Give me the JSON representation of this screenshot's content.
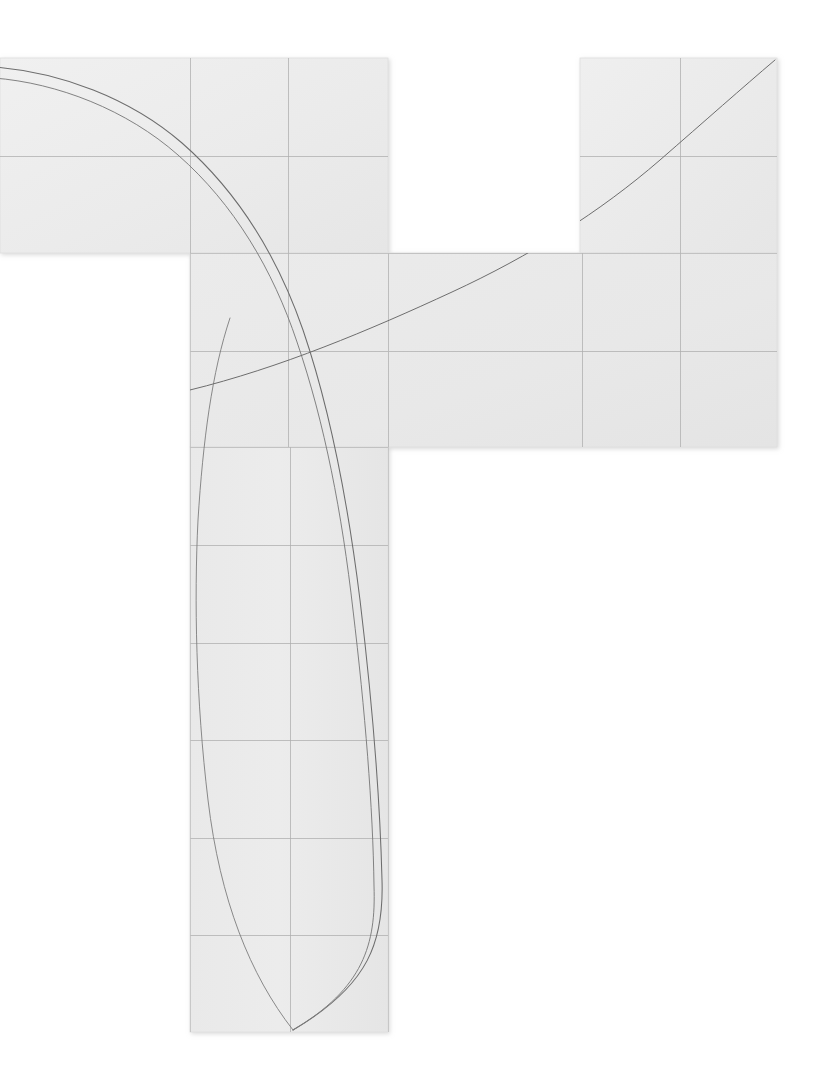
{
  "canvas": {
    "width": 825,
    "height": 1076,
    "background": "#ffffff",
    "title": "Folded grid surface with drawn curves"
  },
  "palette": {
    "paper_fill_light": "#ededed",
    "paper_fill_mid": "#e9e9e9",
    "paper_fill_dark": "#e4e4e4",
    "paper_edge": "#dcdcdc",
    "grid_line": "#a8a8a8",
    "grid_line_soft": "#bdbdbd",
    "curve_stroke": "#6d6d6d",
    "curve_stroke_light": "#8a8a8a",
    "shadow": "#d5d5d5"
  },
  "geometry": {
    "grid_step_x": 98,
    "grid_step_y": 97,
    "vertical_gridlines_x": [
      190,
      288,
      388,
      582,
      680,
      777
    ],
    "horizontal_gridlines_y": [
      156,
      253,
      351,
      447,
      545,
      643,
      740,
      838,
      935
    ],
    "outer_top_y": 58,
    "outer_bottom_y": 1032
  },
  "panels": [
    {
      "name": "top-left-band",
      "x": 0,
      "y": 58,
      "width": 388,
      "height": 195,
      "fill": "#ededed",
      "cols": 4,
      "rows": 2
    },
    {
      "name": "top-right-band",
      "x": 580,
      "y": 58,
      "width": 197,
      "height": 195,
      "fill": "#ededed",
      "cols": 2,
      "rows": 2
    },
    {
      "name": "middle-band",
      "x": 190,
      "y": 253,
      "width": 587,
      "height": 194,
      "fill": "#e9e9e9",
      "cols": 6,
      "rows": 2
    },
    {
      "name": "vertical-column",
      "x": 190,
      "y": 447,
      "width": 198,
      "height": 585,
      "fill": "#e9e9e9",
      "cols": 2,
      "rows": 6
    }
  ],
  "curves": [
    {
      "name": "descending-curve-outer",
      "style": "solid",
      "stroke": "#6d6d6d",
      "stroke_width": 1.05,
      "description": "Long sweeping curve entering at the left edge, crossing the grid diagonally and terminating at the cusp near the bottom of the vertical column.",
      "path": "M -6,67 C 60,72 130,98 182,143 C 238,192 278,258 303,330 C 331,412 348,503 360,600 C 372,700 380,800 382,880 C 384,940 370,985 293,1030"
    },
    {
      "name": "descending-curve-inner",
      "style": "solid",
      "stroke": "#7b7b7b",
      "stroke_width": 0.95,
      "description": "Near-parallel twin of the outer descending curve, offset by a few pixels, converging at the same cusp.",
      "path": "M -6,78 C 58,83 127,110 178,155 C 234,204 273,270 297,342 C 325,424 342,514 353,610 C 365,710 373,808 374,886 C 376,944 364,988 293,1030"
    },
    {
      "name": "descending-curve-left-tail",
      "style": "solid",
      "stroke": "#7d7d7d",
      "stroke_width": 0.9,
      "description": "Left branch of the cusp: mirrored arc rising from the cusp back up through the column toward the upper left of the band.",
      "path": "M 293,1030 C 250,975 220,900 208,800 C 196,700 194,600 198,520 C 203,440 212,372 230,318"
    },
    {
      "name": "ascending-curve",
      "style": "solid",
      "stroke": "#6d6d6d",
      "stroke_width": 1.0,
      "description": "Single ascending S-curve running from the lower-left of the middle band up to the top-right corner of the right band.",
      "path": "M 190,390 C 280,368 370,330 452,292 C 530,256 600,212 660,160 C 706,120 742,88 775,60"
    }
  ],
  "labels": {
    "none_visible": ""
  }
}
